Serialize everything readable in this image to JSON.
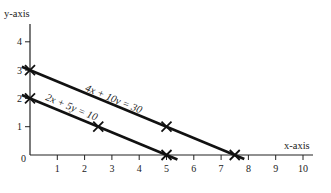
{
  "chart_data": {
    "type": "line",
    "title": "",
    "xlabel": "x-axis",
    "ylabel": "y-axis",
    "xlim": [
      0,
      10.3
    ],
    "ylim": [
      0,
      4.6
    ],
    "xticks": [
      1,
      2,
      3,
      4,
      5,
      6,
      7,
      8,
      9,
      10
    ],
    "yticks": [
      1,
      2,
      3,
      4
    ],
    "origin_label": "0",
    "grid": false,
    "legend": "none",
    "series": [
      {
        "name": "4x + 10y = 30",
        "label": "4x + 10y = 30",
        "line_from": [
          -0.3,
          3.12
        ],
        "line_to": [
          7.85,
          -0.14
        ],
        "points": [
          [
            0,
            3
          ],
          [
            5,
            1
          ],
          [
            7.5,
            0
          ]
        ]
      },
      {
        "name": "2x + 5y = 10",
        "label": "2x + 5y = 10",
        "line_from": [
          -0.3,
          2.12
        ],
        "line_to": [
          5.4,
          -0.16
        ],
        "points": [
          [
            0,
            2
          ],
          [
            2.5,
            1
          ],
          [
            5,
            0
          ]
        ]
      }
    ]
  }
}
